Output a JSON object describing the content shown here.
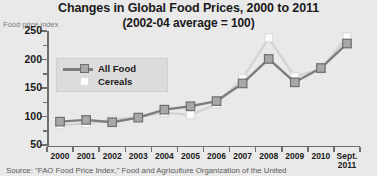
{
  "header": {
    "title": "Changes in Global Food Prices, 2000 to 2011",
    "subtitle": "(2002-04 average = 100)"
  },
  "footer": {
    "source": "Source: \"FAO Food Price Index,\" Food and Agriculture Organization of the United"
  },
  "legend": {
    "items": [
      {
        "label": "All Food",
        "marker": "line-square-marker",
        "color": "#a8a8a8"
      },
      {
        "label": "Cereals",
        "marker": "light-square-marker",
        "color": "#fbfbfb"
      }
    ]
  },
  "colors": {
    "background": "#e9e9e9",
    "axis": "#6e6e6e",
    "all_food_line": "#7d7d7d",
    "all_food_marker": "#a8a8a8",
    "cereals_line": "#d2d2d2",
    "cereals_marker": "#fbfbfb",
    "legend_background": "#dcdcdc",
    "text": "#1a1a1a",
    "muted_text": "#7a7a7a"
  },
  "chart_data": {
    "type": "line",
    "title": "Changes in Global Food Prices, 2000 to 2011",
    "subtitle": "(2002-04 average = 100)",
    "xlabel": "",
    "ylabel": "Food price index",
    "ylim": [
      50,
      250
    ],
    "yticks": [
      50,
      100,
      150,
      200,
      250
    ],
    "yticks_minor": [
      75,
      125,
      175,
      225
    ],
    "grid": false,
    "legend_position": "upper-left-inside",
    "categories": [
      "2000",
      "2001",
      "2002",
      "2003",
      "2004",
      "2005",
      "2006",
      "2007",
      "2008",
      "2009",
      "2010",
      "Sept.\n2011"
    ],
    "x_tick_labels": [
      "2000",
      "2001",
      "2002",
      "2003",
      "2004",
      "2005",
      "2006",
      "2007",
      "2008",
      "2009",
      "2010",
      "Sept. 2011"
    ],
    "last_label_line1": "Sept.",
    "last_label_line2": "2011",
    "series": [
      {
        "name": "All Food",
        "values": [
          91,
          94,
          90,
          98,
          112,
          118,
          127,
          158,
          201,
          160,
          185,
          228
        ]
      },
      {
        "name": "Cereals",
        "values": [
          85,
          88,
          94,
          99,
          107,
          103,
          122,
          167,
          238,
          170,
          183,
          240
        ]
      }
    ]
  }
}
